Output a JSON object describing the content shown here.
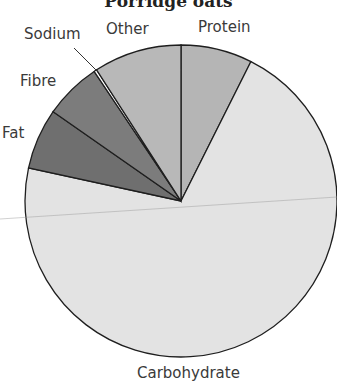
{
  "chart_data": {
    "type": "pie",
    "title": "Porridge oats",
    "categories": [
      "Protein",
      "Carbohydrate",
      "Fat",
      "Fibre",
      "Sodium",
      "Other"
    ],
    "values": [
      7.4,
      71.0,
      6.3,
      5.9,
      0.3,
      9.1
    ],
    "colors": [
      "#b5b5b5",
      "#e3e3e3",
      "#6f6f6f",
      "#7c7c7c",
      "#ffffff",
      "#b8b8b8"
    ],
    "start_angle_deg": 0,
    "direction": "clockwise",
    "legend": "none (direct labels)"
  },
  "labels": {
    "protein": "Protein",
    "carbohydrate": "Carbohydrate",
    "fat": "Fat",
    "fibre": "Fibre",
    "sodium": "Sodium",
    "other": "Other"
  }
}
